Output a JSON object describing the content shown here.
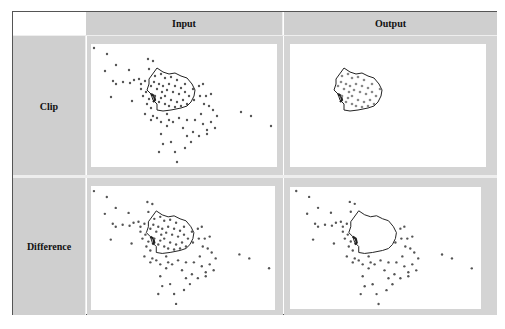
{
  "table": {
    "corner_label": "",
    "columns": [
      {
        "label": "Input"
      },
      {
        "label": "Output"
      }
    ],
    "rows": [
      {
        "label": "Clip"
      },
      {
        "label": "Difference"
      }
    ]
  },
  "figure": {
    "point_color": "#555555",
    "polygon_color": "#222222",
    "panels": [
      {
        "row": "Clip",
        "column": "Input",
        "content": "all points with polygon outline"
      },
      {
        "row": "Clip",
        "column": "Output",
        "content": "only points inside polygon"
      },
      {
        "row": "Difference",
        "column": "Input",
        "content": "all points with polygon outline"
      },
      {
        "row": "Difference",
        "column": "Output",
        "content": "only points outside polygon"
      }
    ],
    "polygon": [
      [
        58,
        35
      ],
      [
        66,
        24
      ],
      [
        72,
        28
      ],
      [
        78,
        30
      ],
      [
        84,
        29
      ],
      [
        90,
        32
      ],
      [
        96,
        34
      ],
      [
        101,
        40
      ],
      [
        104,
        46
      ],
      [
        103,
        52
      ],
      [
        100,
        58
      ],
      [
        96,
        62
      ],
      [
        90,
        64
      ],
      [
        80,
        66
      ],
      [
        72,
        67
      ],
      [
        66,
        66
      ],
      [
        66,
        60
      ],
      [
        62,
        56
      ],
      [
        60,
        50
      ],
      [
        56,
        46
      ],
      [
        58,
        40
      ]
    ],
    "points": [
      [
        3,
        4
      ],
      [
        16,
        10
      ],
      [
        25,
        21
      ],
      [
        14,
        27
      ],
      [
        38,
        26
      ],
      [
        22,
        37
      ],
      [
        25,
        40
      ],
      [
        32,
        38
      ],
      [
        39,
        39
      ],
      [
        43,
        36
      ],
      [
        48,
        35
      ],
      [
        50,
        40
      ],
      [
        54,
        37
      ],
      [
        20,
        53
      ],
      [
        41,
        57
      ],
      [
        57,
        15
      ],
      [
        62,
        17
      ],
      [
        58,
        25
      ],
      [
        64,
        32
      ],
      [
        70,
        30
      ],
      [
        74,
        34
      ],
      [
        80,
        33
      ],
      [
        86,
        36
      ],
      [
        63,
        38
      ],
      [
        68,
        40
      ],
      [
        72,
        42
      ],
      [
        78,
        40
      ],
      [
        84,
        42
      ],
      [
        90,
        44
      ],
      [
        94,
        40
      ],
      [
        60,
        42
      ],
      [
        66,
        45
      ],
      [
        71,
        48
      ],
      [
        76,
        46
      ],
      [
        82,
        48
      ],
      [
        88,
        50
      ],
      [
        94,
        48
      ],
      [
        98,
        52
      ],
      [
        64,
        52
      ],
      [
        70,
        54
      ],
      [
        74,
        52
      ],
      [
        80,
        56
      ],
      [
        86,
        58
      ],
      [
        92,
        56
      ],
      [
        96,
        60
      ],
      [
        68,
        58
      ],
      [
        74,
        60
      ],
      [
        78,
        62
      ],
      [
        84,
        63
      ],
      [
        90,
        62
      ],
      [
        55,
        48
      ],
      [
        50,
        45
      ],
      [
        52,
        52
      ],
      [
        58,
        55
      ],
      [
        56,
        60
      ],
      [
        60,
        64
      ],
      [
        54,
        70
      ],
      [
        62,
        72
      ],
      [
        102,
        45
      ],
      [
        108,
        42
      ],
      [
        112,
        40
      ],
      [
        103,
        56
      ],
      [
        109,
        52
      ],
      [
        115,
        52
      ],
      [
        120,
        50
      ],
      [
        113,
        60
      ],
      [
        118,
        62
      ],
      [
        122,
        66
      ],
      [
        126,
        72
      ],
      [
        60,
        76
      ],
      [
        66,
        74
      ],
      [
        70,
        78
      ],
      [
        76,
        70
      ],
      [
        78,
        76
      ],
      [
        82,
        78
      ],
      [
        88,
        74
      ],
      [
        96,
        76
      ],
      [
        104,
        76
      ],
      [
        112,
        80
      ],
      [
        120,
        78
      ],
      [
        124,
        84
      ],
      [
        102,
        88
      ],
      [
        108,
        92
      ],
      [
        116,
        90
      ],
      [
        70,
        90
      ],
      [
        72,
        100
      ],
      [
        68,
        108
      ],
      [
        80,
        98
      ],
      [
        84,
        108
      ],
      [
        96,
        92
      ],
      [
        100,
        98
      ],
      [
        94,
        104
      ],
      [
        86,
        118
      ],
      [
        116,
        86
      ],
      [
        150,
        68
      ],
      [
        160,
        72
      ],
      [
        180,
        82
      ],
      [
        76,
        82
      ],
      [
        92,
        84
      ],
      [
        110,
        70
      ]
    ]
  }
}
